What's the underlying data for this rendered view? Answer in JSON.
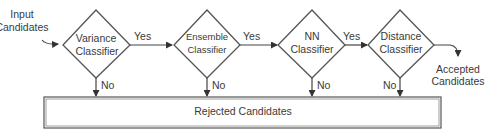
{
  "diagram": {
    "type": "flowchart",
    "input": {
      "line1": "Input",
      "line2": "Candidates"
    },
    "nodes": [
      {
        "id": "variance",
        "line1": "Variance",
        "line2": "Classifier"
      },
      {
        "id": "ensemble",
        "line1": "Ensemble",
        "line2": "Classifier"
      },
      {
        "id": "nn",
        "line1": "NN",
        "line2": "Classifier"
      },
      {
        "id": "distance",
        "line1": "Distance",
        "line2": "Classifier"
      }
    ],
    "edges": {
      "yes_label": "Yes",
      "no_label": "No"
    },
    "output": {
      "line1": "Accepted",
      "line2": "Candidates"
    },
    "rejected": {
      "label": "Rejected Candidates"
    },
    "colors": {
      "stroke": "#555555",
      "text": "#3a3a3a",
      "background": "#ffffff"
    }
  }
}
